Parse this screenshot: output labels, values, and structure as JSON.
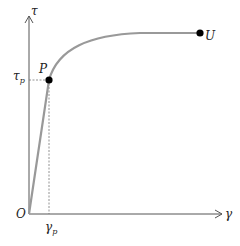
{
  "diagram": {
    "type": "stress-strain curve",
    "y_axis_label": "τ",
    "x_axis_label": "γ",
    "origin_label": "O",
    "point_p": {
      "label": "P",
      "tau_label": "τ",
      "tau_sub": "p",
      "gamma_label": "γ",
      "gamma_sub": "p"
    },
    "point_u": {
      "label": "U"
    },
    "colors": {
      "axis": "#555555",
      "curve": "#999999",
      "point": "#000000"
    }
  }
}
